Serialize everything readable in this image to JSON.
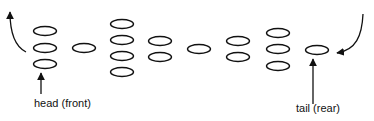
{
  "labels": {
    "head": "head (front)",
    "tail": "tail (rear)"
  },
  "colors": {
    "stroke": "#111111",
    "background": "#ffffff"
  },
  "groups": [
    {
      "name": "group-1",
      "x": 45,
      "ys": [
        31,
        48,
        64
      ]
    },
    {
      "name": "group-2",
      "x": 84,
      "ys": [
        48
      ]
    },
    {
      "name": "group-3",
      "x": 122,
      "ys": [
        24,
        40,
        56,
        72
      ]
    },
    {
      "name": "group-4",
      "x": 160,
      "ys": [
        41,
        57
      ]
    },
    {
      "name": "group-5",
      "x": 199,
      "ys": [
        49
      ]
    },
    {
      "name": "group-6",
      "x": 238,
      "ys": [
        41,
        57
      ]
    },
    {
      "name": "group-7",
      "x": 278,
      "ys": [
        33,
        49,
        66
      ]
    },
    {
      "name": "group-8-tail",
      "x": 317,
      "ys": [
        50
      ]
    }
  ]
}
